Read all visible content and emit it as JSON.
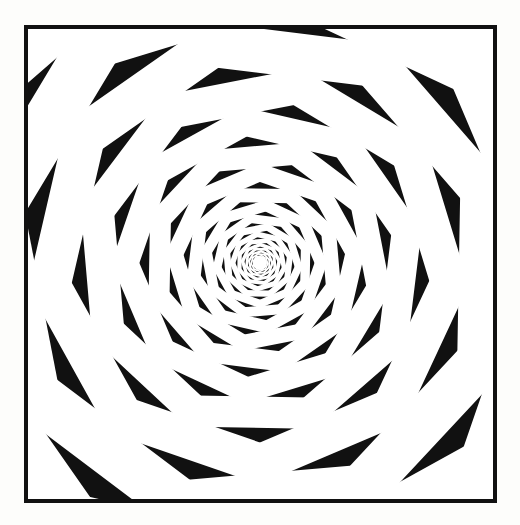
{
  "page": {
    "background_color": "#fdfdfb",
    "width": 520,
    "height": 525
  },
  "plate": {
    "name": "spiral-illusion-plate",
    "x": 24,
    "y": 25,
    "width": 473,
    "height": 478,
    "frame_color": "#111111",
    "frame_width": 4,
    "background_color": "#ffffff",
    "caption": ""
  },
  "figure": {
    "type": "fraser-spiral-illusion",
    "center_x": 236,
    "center_y": 238,
    "center_dot_radius": 7,
    "center_dot_color": "#ffffff",
    "max_radius": 360
  },
  "colors": {
    "black": "#141414",
    "white": "#ffffff",
    "grey": "#919191",
    "grey_light": "#a8a8a8",
    "band_fill": "#ffffff",
    "band_edge": "#111111",
    "page": "#fdfdfb"
  },
  "chart_data": {
    "type": "scatter",
    "xlabel": "",
    "ylabel": "",
    "spiral": {
      "kind": "logarithmic",
      "growth_per_turn": 1.255,
      "start_radius": 5.0,
      "turns": 21,
      "band_width_ratio": 0.195,
      "edge_width_ratio": 0.085,
      "twist_deg_per_ring": 17
    },
    "checker": {
      "sectors": 18,
      "rings_per_band": 2,
      "cell_sequence": [
        "grey",
        "black",
        "grey",
        "white"
      ],
      "stagger_deg": 10
    },
    "ring_radii": [
      5.0,
      6.3,
      7.9,
      9.9,
      12.4,
      15.6,
      19.5,
      24.5,
      30.8,
      38.6,
      48.5,
      60.8,
      76.3,
      95.8,
      120.2,
      150.9,
      189.4,
      237.7,
      298.3,
      374.4,
      469.9
    ]
  }
}
